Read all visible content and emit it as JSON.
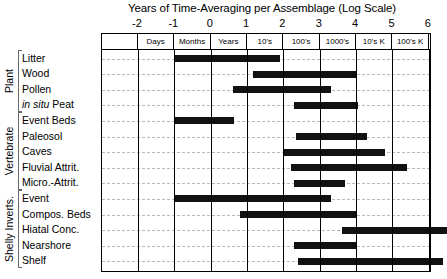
{
  "chart_data": {
    "type": "bar",
    "orientation": "horizontal",
    "title": "Years of Time-Averaging per Assemblage (Log Scale)",
    "xlabel": "Years of Time-Averaging per Assemblage (Log Scale)",
    "ylabel": "",
    "xlim": [
      -2.5,
      6.5
    ],
    "grid": true,
    "legend": null,
    "xticks": [
      -2,
      -1,
      0,
      1,
      2,
      3,
      4,
      5,
      6
    ],
    "xticklabels": [
      "-2",
      "-1",
      "0",
      "1",
      "2",
      "3",
      "4",
      "5",
      "6"
    ],
    "unit_bands": [
      {
        "label": "",
        "start": -2.5,
        "end": -2
      },
      {
        "label": "Days",
        "start": -2,
        "end": -1
      },
      {
        "label": "Months",
        "start": -1,
        "end": 0
      },
      {
        "label": "Years",
        "start": 0,
        "end": 1
      },
      {
        "label": "10's",
        "start": 1,
        "end": 2
      },
      {
        "label": "100's",
        "start": 2,
        "end": 3
      },
      {
        "label": "1000's",
        "start": 3,
        "end": 4
      },
      {
        "label": "10's K",
        "start": 4,
        "end": 5
      },
      {
        "label": "100's K",
        "start": 5,
        "end": 6
      },
      {
        "label": "",
        "start": 6,
        "end": 6.5
      }
    ],
    "groups": [
      {
        "name": "Plant",
        "categories": [
          "Litter",
          "Wood",
          "Pollen",
          "in situ Peat"
        ],
        "ranges": [
          [
            -1.0,
            1.9
          ],
          [
            1.15,
            4.0
          ],
          [
            0.6,
            3.3
          ],
          [
            2.3,
            4.05
          ]
        ]
      },
      {
        "name": "Vertebrate",
        "categories": [
          "Event Beds",
          "Paleosol",
          "Caves",
          "Fluvial Attrit.",
          "Micro.-Attrit."
        ],
        "ranges": [
          [
            -1.0,
            0.65
          ],
          [
            2.35,
            4.3
          ],
          [
            2.0,
            4.8
          ],
          [
            2.2,
            5.4
          ],
          [
            2.3,
            3.7
          ]
        ]
      },
      {
        "name": "Shelly Inverts.",
        "categories": [
          "Event",
          "Compos. Beds",
          "Hiatal Conc.",
          "Nearshore",
          "Shelf"
        ],
        "ranges": [
          [
            -1.0,
            3.3
          ],
          [
            0.8,
            4.0
          ],
          [
            3.6,
            6.5
          ],
          [
            2.3,
            4.0
          ],
          [
            2.4,
            6.4
          ]
        ]
      }
    ],
    "series_color": "#111111"
  },
  "rows": [
    {
      "label": "Litter",
      "italic_prefix": "",
      "group": "Plant"
    },
    {
      "label": "Wood",
      "italic_prefix": "",
      "group": "Plant"
    },
    {
      "label": "Pollen",
      "italic_prefix": "",
      "group": "Plant"
    },
    {
      "label": "Peat",
      "italic_prefix": "in situ",
      "group": "Plant"
    },
    {
      "label": "Event Beds",
      "italic_prefix": "",
      "group": "Vertebrate"
    },
    {
      "label": "Paleosol",
      "italic_prefix": "",
      "group": "Vertebrate"
    },
    {
      "label": "Caves",
      "italic_prefix": "",
      "group": "Vertebrate"
    },
    {
      "label": "Fluvial Attrit.",
      "italic_prefix": "",
      "group": "Vertebrate"
    },
    {
      "label": "Micro.-Attrit.",
      "italic_prefix": "",
      "group": "Vertebrate"
    },
    {
      "label": "Event",
      "italic_prefix": "",
      "group": "Shelly Inverts."
    },
    {
      "label": "Compos. Beds",
      "italic_prefix": "",
      "group": "Shelly Inverts."
    },
    {
      "label": "Hiatal Conc.",
      "italic_prefix": "",
      "group": "Shelly Inverts."
    },
    {
      "label": "Nearshore",
      "italic_prefix": "",
      "group": "Shelly Inverts."
    },
    {
      "label": "Shelf",
      "italic_prefix": "",
      "group": "Shelly Inverts."
    }
  ],
  "group_labels": [
    "Plant",
    "Vertebrate",
    "Shelly Inverts."
  ]
}
